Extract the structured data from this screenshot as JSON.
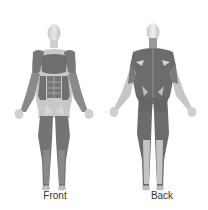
{
  "figures": [
    {
      "id": "front",
      "label": "Front"
    },
    {
      "id": "back",
      "label": "Back"
    }
  ],
  "colors": {
    "skin": "#d8d8d8",
    "muscle": "#6e6e6e",
    "highlight": "#bdbdbd"
  }
}
